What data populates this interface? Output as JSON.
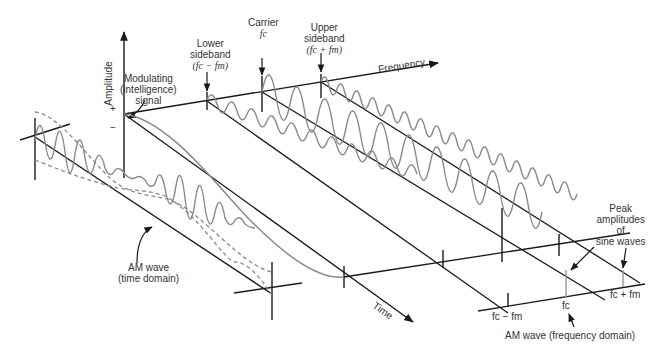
{
  "diagram": {
    "axes": {
      "amplitude": "Amplitude",
      "frequency": "Frequency",
      "time": "Time",
      "plus": "+",
      "minus": "−"
    },
    "labels": {
      "modulating": [
        "Modulating",
        "(intelligence)",
        "signal"
      ],
      "lower_sideband": [
        "Lower",
        "sideband",
        "(fc − fm)"
      ],
      "carrier": [
        "Carrier",
        "fc"
      ],
      "upper_sideband": [
        "Upper",
        "sideband",
        "(fc + fm)"
      ],
      "am_time": [
        "AM wave",
        "(time domain)"
      ],
      "peak": [
        "Peak",
        "amplitudes",
        "of",
        "sine waves"
      ],
      "am_freq": "AM wave (frequency domain)",
      "fc_minus_fm": "fc − fm",
      "fc": "fc",
      "fc_plus_fm": "fc + fm"
    },
    "colors": {
      "axis": "#1a1a1a",
      "wave": "#8a8a8a",
      "text": "#333333"
    }
  }
}
